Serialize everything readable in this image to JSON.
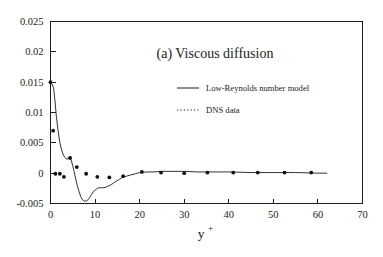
{
  "figure": {
    "panel_label": "(a) Viscous diffusion",
    "background_color": "#ffffff",
    "ink_color": "#1c1c1c"
  },
  "legend": {
    "position": "upper-right-inside",
    "entries": [
      {
        "label": "Low-Reynolds number model",
        "style": "solid-line",
        "marker": "none"
      },
      {
        "label": "DNS data",
        "style": "dotted-line",
        "marker": "dot"
      }
    ]
  },
  "axes": {
    "x": {
      "label_base": "y",
      "label_superscript": "+",
      "ticks": [
        "0",
        "10",
        "20",
        "30",
        "40",
        "50",
        "60",
        "70"
      ],
      "tick_values": [
        0,
        10,
        20,
        30,
        40,
        50,
        60,
        70
      ],
      "range": [
        0,
        70
      ]
    },
    "y": {
      "label": "",
      "ticks": [
        "0.025",
        "0.02",
        "0.015",
        "0.01",
        "0.005",
        "0",
        "-0.005"
      ],
      "tick_values": [
        0.025,
        0.02,
        0.015,
        0.01,
        0.005,
        0,
        -0.005
      ],
      "range": [
        -0.005,
        0.025
      ]
    }
  },
  "chart_data": {
    "type": "line",
    "title": "(a) Viscous diffusion",
    "xlabel": "y+",
    "ylabel": "",
    "xlim": [
      0,
      70
    ],
    "ylim": [
      -0.005,
      0.025
    ],
    "grid": false,
    "legend_position": "upper right (inside axes)",
    "xticks": [
      0,
      10,
      20,
      30,
      40,
      50,
      60,
      70
    ],
    "yticks": [
      0.025,
      0.02,
      0.015,
      0.01,
      0.005,
      0,
      -0.005
    ],
    "series": [
      {
        "name": "Low-Reynolds number model",
        "type": "line",
        "style": "solid",
        "x": [
          0.0,
          0.35,
          0.7,
          1.0,
          1.3,
          1.7,
          2.1,
          2.5,
          2.9,
          3.2,
          3.5,
          3.8,
          4.0,
          4.2,
          4.4,
          4.7,
          5.0,
          5.3,
          5.6,
          6.0,
          6.4,
          6.8,
          7.2,
          7.6,
          8.0,
          8.4,
          8.8,
          9.2,
          9.6,
          10.0,
          10.5,
          11.0,
          11.5,
          12.0,
          12.5,
          13.0,
          13.6,
          14.2,
          14.8,
          15.5,
          16.2,
          17.0,
          18.0,
          19.0,
          20.0,
          21.5,
          23.0,
          25.0,
          27.0,
          30.0,
          33.0,
          36.0,
          40.0,
          45.0,
          50.0,
          55.0,
          60.0,
          62.0
        ],
        "y": [
          0.0148,
          0.0147,
          0.014,
          0.012,
          0.0095,
          0.007,
          0.005,
          0.0038,
          0.003,
          0.0026,
          0.0024,
          0.0023,
          0.0026,
          0.0026,
          0.0025,
          0.002,
          0.0012,
          0.0003,
          -0.0008,
          -0.002,
          -0.003,
          -0.0039,
          -0.0044,
          -0.0046,
          -0.0046,
          -0.0044,
          -0.004,
          -0.0035,
          -0.0031,
          -0.0028,
          -0.0025,
          -0.0024,
          -0.0024,
          -0.0024,
          -0.0023,
          -0.0021,
          -0.0019,
          -0.0016,
          -0.0013,
          -0.001,
          -0.0007,
          -0.0005,
          -0.0003,
          -0.0001,
          0.0001,
          0.0002,
          0.0002,
          0.0003,
          0.0003,
          0.0003,
          0.0002,
          0.0002,
          0.0002,
          0.0001,
          0.0001,
          0.0001,
          0.0,
          0.0
        ]
      },
      {
        "name": "DNS data",
        "type": "scatter",
        "style": "dotted",
        "marker": "filled-circle",
        "x": [
          0.0,
          0.6,
          1.1,
          2.1,
          3.0,
          4.4,
          5.9,
          8.0,
          10.5,
          13.2,
          16.3,
          20.5,
          24.8,
          30.0,
          35.2,
          41.0,
          46.5,
          52.5,
          58.5
        ],
        "y": [
          0.015,
          0.007,
          -0.0001,
          -0.0001,
          -0.0006,
          0.0025,
          0.001,
          -0.0001,
          -0.0006,
          -0.0007,
          -0.0005,
          0.0002,
          0.0001,
          0.0,
          0.0001,
          0.0001,
          0.0001,
          0.0001,
          0.0001
        ]
      }
    ]
  }
}
